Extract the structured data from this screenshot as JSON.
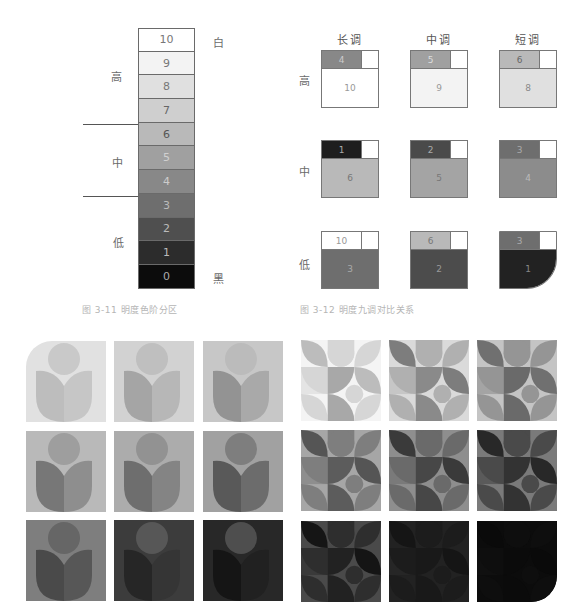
{
  "figure_3_11": {
    "caption": "图 3-11  明度色阶分区",
    "scale": [
      {
        "value": "10",
        "bg": "#ffffff",
        "fg": "#777777"
      },
      {
        "value": "9",
        "bg": "#f3f3f3",
        "fg": "#777777"
      },
      {
        "value": "8",
        "bg": "#e0e0e0",
        "fg": "#777777"
      },
      {
        "value": "7",
        "bg": "#cfcfcf",
        "fg": "#666666"
      },
      {
        "value": "6",
        "bg": "#b9b9b9",
        "fg": "#555555"
      },
      {
        "value": "5",
        "bg": "#a0a0a0",
        "fg": "#d0d0d0"
      },
      {
        "value": "4",
        "bg": "#888888",
        "fg": "#cccccc"
      },
      {
        "value": "3",
        "bg": "#6e6e6e",
        "fg": "#bbbbbb"
      },
      {
        "value": "2",
        "bg": "#4f4f4f",
        "fg": "#bbbbbb"
      },
      {
        "value": "1",
        "bg": "#2c2c2c",
        "fg": "#bbbbbb"
      },
      {
        "value": "0",
        "bg": "#0c0c0c",
        "fg": "#aaaaaa"
      }
    ],
    "zones": {
      "high": "高",
      "mid": "中",
      "low": "低"
    },
    "ends": {
      "white": "白",
      "black": "黑"
    }
  },
  "figure_3_12": {
    "caption": "图 3-12  明度九调对比关系",
    "columns": [
      "长调",
      "中调",
      "短调"
    ],
    "rows": [
      "高",
      "中",
      "低"
    ],
    "cells": [
      [
        {
          "accent": "4",
          "accent_bg": "#888888",
          "accent_fg": "#cccccc",
          "base": "10",
          "base_bg": "#ffffff",
          "base_fg": "#999999"
        },
        {
          "accent": "5",
          "accent_bg": "#a0a0a0",
          "accent_fg": "#dddddd",
          "base": "9",
          "base_bg": "#f3f3f3",
          "base_fg": "#999999"
        },
        {
          "accent": "6",
          "accent_bg": "#b9b9b9",
          "accent_fg": "#666666",
          "base": "8",
          "base_bg": "#e0e0e0",
          "base_fg": "#888888"
        }
      ],
      [
        {
          "accent": "1",
          "accent_bg": "#1e1e1e",
          "accent_fg": "#aaaaaa",
          "base": "6",
          "base_bg": "#b9b9b9",
          "base_fg": "#777777"
        },
        {
          "accent": "2",
          "accent_bg": "#4a4a4a",
          "accent_fg": "#aaaaaa",
          "base": "5",
          "base_bg": "#a4a4a4",
          "base_fg": "#777777"
        },
        {
          "accent": "3",
          "accent_bg": "#6e6e6e",
          "accent_fg": "#aaaaaa",
          "base": "4",
          "base_bg": "#8c8c8c",
          "base_fg": "#bbbbbb"
        }
      ],
      [
        {
          "accent": "10",
          "accent_bg": "#ffffff",
          "accent_fg": "#999999",
          "base": "3",
          "base_bg": "#6e6e6e",
          "base_fg": "#aaaaaa"
        },
        {
          "accent": "6",
          "accent_bg": "#b9b9b9",
          "accent_fg": "#777777",
          "base": "2",
          "base_bg": "#4c4c4c",
          "base_fg": "#999999"
        },
        {
          "accent": "3",
          "accent_bg": "#6e6e6e",
          "accent_fg": "#aaaaaa",
          "base": "1",
          "base_bg": "#222222",
          "base_fg": "#888888"
        }
      ]
    ]
  },
  "tulip_grid": {
    "tiles": [
      {
        "bg": "#e1e1e1",
        "circle": "#c9c9c9",
        "leaf_left": "#bdbdbd",
        "leaf_right": "#c6c6c6"
      },
      {
        "bg": "#d2d2d2",
        "circle": "#bfbfbf",
        "leaf_left": "#a5a5a5",
        "leaf_right": "#b7b7b7"
      },
      {
        "bg": "#c7c7c7",
        "circle": "#bbbbbb",
        "leaf_left": "#939393",
        "leaf_right": "#a9a9a9"
      },
      {
        "bg": "#b9b9b9",
        "circle": "#9e9e9e",
        "leaf_left": "#777777",
        "leaf_right": "#8e8e8e"
      },
      {
        "bg": "#acacac",
        "circle": "#929292",
        "leaf_left": "#6e6e6e",
        "leaf_right": "#848484"
      },
      {
        "bg": "#a1a1a1",
        "circle": "#7e7e7e",
        "leaf_left": "#595959",
        "leaf_right": "#6c6c6c"
      },
      {
        "bg": "#7e7e7e",
        "circle": "#666666",
        "leaf_left": "#4a4a4a",
        "leaf_right": "#575757"
      },
      {
        "bg": "#3c3c3c",
        "circle": "#575757",
        "leaf_left": "#262626",
        "leaf_right": "#353535"
      },
      {
        "bg": "#282828",
        "circle": "#4e4e4e",
        "leaf_left": "#151515",
        "leaf_right": "#212121"
      }
    ]
  },
  "geometric_grid": {
    "tiles": [
      {
        "bg": "#f4f4f4",
        "a": "#bcbcbc",
        "b": "#d6d6d6",
        "c": "#a8a8a8",
        "d": "#e4e4e4"
      },
      {
        "bg": "#dadada",
        "a": "#7d7d7d",
        "b": "#b0b0b0",
        "c": "#8a8a8a",
        "d": "#c6c6c6"
      },
      {
        "bg": "#c4c4c4",
        "a": "#707070",
        "b": "#959595",
        "c": "#6a6a6a",
        "d": "#a4a4a4"
      },
      {
        "bg": "#a6a6a6",
        "a": "#555555",
        "b": "#7e7e7e",
        "c": "#5c5c5c",
        "d": "#8e8e8e"
      },
      {
        "bg": "#8e8e8e",
        "a": "#3a3a3a",
        "b": "#6a6a6a",
        "c": "#474747",
        "d": "#7a7a7a"
      },
      {
        "bg": "#7a7a7a",
        "a": "#282828",
        "b": "#4a4a4a",
        "c": "#333333",
        "d": "#5a5a5a"
      },
      {
        "bg": "#4a4a4a",
        "a": "#151515",
        "b": "#2e2e2e",
        "c": "#222222",
        "d": "#3a3a3a"
      },
      {
        "bg": "#222222",
        "a": "#151515",
        "b": "#1c1c1c",
        "c": "#191919",
        "d": "#262626"
      },
      {
        "bg": "#0c0c0c",
        "a": "#0a0a0a",
        "b": "#0e0e0e",
        "c": "#0b0b0b",
        "d": "#101010"
      }
    ]
  }
}
